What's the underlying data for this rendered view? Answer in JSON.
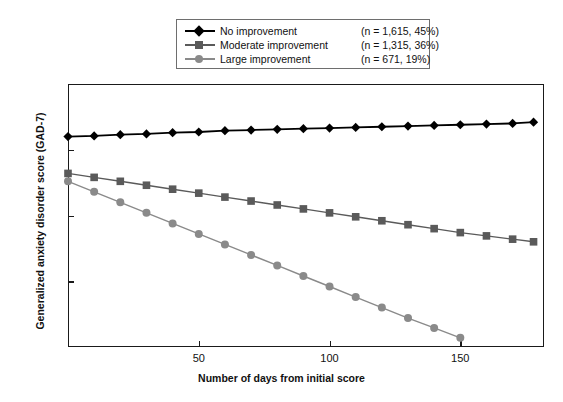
{
  "chart_data": {
    "type": "line",
    "title": "",
    "xlabel": "Number of days from initial score",
    "ylabel": "Generalized anxiety disorder score (GAD-7)",
    "xlim": [
      0,
      182
    ],
    "ylim": [
      0,
      20
    ],
    "xticks": [
      50,
      100,
      150
    ],
    "yticks": [
      0,
      5,
      10,
      15,
      20
    ],
    "grid": false,
    "legend_position": "top-center",
    "series": [
      {
        "name": "No improvement",
        "legend_note": "(n = 1,615, 45%)",
        "n": 1615,
        "percent": 45,
        "color": "#000000",
        "marker": "diamond",
        "x": [
          0,
          10,
          20,
          30,
          40,
          50,
          60,
          70,
          80,
          90,
          100,
          110,
          120,
          130,
          140,
          150,
          160,
          170,
          178
        ],
        "y": [
          16.0,
          16.05,
          16.15,
          16.2,
          16.3,
          16.35,
          16.45,
          16.5,
          16.55,
          16.6,
          16.65,
          16.7,
          16.75,
          16.8,
          16.85,
          16.9,
          16.95,
          17.0,
          17.1
        ]
      },
      {
        "name": "Moderate improvement",
        "legend_note": "(n = 1,315, 36%)",
        "n": 1315,
        "percent": 36,
        "color": "#5a5a5a",
        "marker": "square",
        "x": [
          0,
          10,
          20,
          30,
          40,
          50,
          60,
          70,
          80,
          90,
          100,
          110,
          120,
          130,
          140,
          150,
          160,
          170,
          178
        ],
        "y": [
          13.2,
          12.9,
          12.6,
          12.3,
          12.0,
          11.7,
          11.4,
          11.1,
          10.8,
          10.5,
          10.2,
          9.9,
          9.6,
          9.3,
          9.0,
          8.7,
          8.45,
          8.2,
          8.0
        ]
      },
      {
        "name": "Large improvement",
        "legend_note": "(n = 671, 19%)",
        "n": 671,
        "percent": 19,
        "color": "#8a8a8a",
        "marker": "circle",
        "x": [
          0,
          10,
          20,
          30,
          40,
          50,
          60,
          70,
          80,
          90,
          100,
          110,
          120,
          130,
          140,
          150
        ],
        "y": [
          12.6,
          11.8,
          11.0,
          10.2,
          9.4,
          8.6,
          7.8,
          7.0,
          6.2,
          5.4,
          4.6,
          3.8,
          3.0,
          2.2,
          1.45,
          0.7
        ]
      }
    ]
  },
  "legend": {
    "rows": [
      {
        "label": "No improvement",
        "note": "(n = 1,615, 45%)"
      },
      {
        "label": "Moderate improvement",
        "note": "(n = 1,315, 36%)"
      },
      {
        "label": "Large improvement",
        "note": "(n = 671, 19%)"
      }
    ]
  },
  "axes": {
    "y_tick_labels": [
      "20",
      "15",
      "10",
      "5",
      "0"
    ],
    "x_tick_labels": [
      "50",
      "100",
      "150"
    ],
    "y_axis_title": "Generalized anxiety disorder score (GAD-7)",
    "x_axis_title": "Number of days from initial score"
  }
}
